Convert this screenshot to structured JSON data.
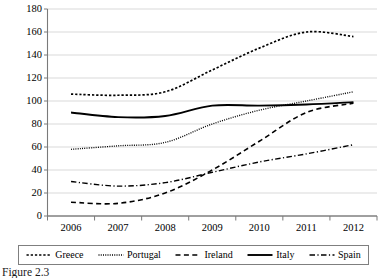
{
  "chart_data": {
    "type": "line",
    "title": "",
    "xlabel": "",
    "ylabel": "",
    "categories": [
      "2006",
      "2007",
      "2008",
      "2009",
      "2010",
      "2011",
      "2012"
    ],
    "x": [
      2006,
      2007,
      2008,
      2009,
      2010,
      2011,
      2012
    ],
    "ylim": [
      0,
      180
    ],
    "ytick_values": [
      0,
      20,
      40,
      60,
      80,
      100,
      120,
      140,
      160,
      180
    ],
    "ytick_labels": [
      "0",
      "20",
      "40",
      "60",
      "80",
      "100",
      "120",
      "140",
      "160",
      "180"
    ],
    "grid": "horizontal",
    "legend_position": "bottom",
    "series": [
      {
        "name": "Greece",
        "style": "dotted-square",
        "color": "#000000",
        "values": [
          106,
          105,
          108,
          127,
          146,
          160,
          156
        ]
      },
      {
        "name": "Portugal",
        "style": "fine-dotted",
        "color": "#000000",
        "values": [
          58,
          61,
          64,
          80,
          92,
          100,
          108
        ]
      },
      {
        "name": "Ireland",
        "style": "dashed",
        "color": "#000000",
        "values": [
          12,
          11,
          20,
          40,
          65,
          90,
          98
        ]
      },
      {
        "name": "Italy",
        "style": "solid",
        "color": "#000000",
        "values": [
          90,
          86,
          87,
          96,
          96,
          97,
          99
        ]
      },
      {
        "name": "Spain",
        "style": "dash-dot",
        "color": "#000000",
        "values": [
          30,
          26,
          29,
          38,
          47,
          54,
          62
        ]
      }
    ]
  },
  "legend": {
    "entries": [
      {
        "label": "Greece"
      },
      {
        "label": "Portugal"
      },
      {
        "label": "Ireland"
      },
      {
        "label": "Italy"
      },
      {
        "label": "Spain"
      }
    ]
  },
  "caption": {
    "text": "Figure 2.3"
  }
}
